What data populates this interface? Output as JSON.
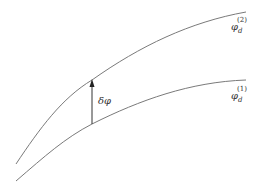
{
  "diagram": {
    "curves": [
      {
        "id": "curve-upper",
        "label_base": "φ",
        "label_sub": "d",
        "label_sup": "(2)",
        "color": "#7a7a7a"
      },
      {
        "id": "curve-lower",
        "label_base": "φ",
        "label_sub": "d",
        "label_sup": "(1)",
        "color": "#7a7a7a"
      }
    ],
    "arrow": {
      "label": "δφ",
      "color": "#333333"
    }
  }
}
